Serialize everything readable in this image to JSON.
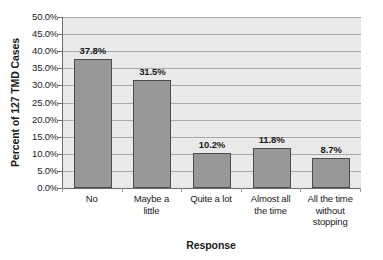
{
  "chart_data": {
    "type": "bar",
    "title": "",
    "xlabel": "Response",
    "ylabel": "Percent of 127 TMD Cases",
    "categories": [
      "No",
      "Maybe a little",
      "Quite a lot",
      "Almost all the time",
      "All the time without stopping"
    ],
    "category_lines": [
      [
        "No"
      ],
      [
        "Maybe a",
        "little"
      ],
      [
        "Quite a lot"
      ],
      [
        "Almost all",
        "the time"
      ],
      [
        "All the time",
        "without",
        "stopping"
      ]
    ],
    "values": [
      37.8,
      31.5,
      10.2,
      11.8,
      8.7
    ],
    "value_labels": [
      "37.8%",
      "31.5%",
      "10.2%",
      "11.8%",
      "8.7%"
    ],
    "ylim": [
      0,
      50
    ],
    "ytick_values": [
      0,
      5,
      10,
      15,
      20,
      25,
      30,
      35,
      40,
      45,
      50
    ],
    "ytick_labels": [
      "0.0%",
      "5.0%",
      "10.0%",
      "15.0%",
      "20.0%",
      "25.0%",
      "30.0%",
      "35.0%",
      "40.0%",
      "45.0%",
      "50.0%"
    ],
    "grid": "horizontal",
    "legend": "none",
    "colors": {
      "bar_fill": "#989898",
      "bar_border": "#4d4d4d",
      "plot_background": "#e9e9e9",
      "gridline": "#a9a9a9",
      "axis_line": "#6e6e6e",
      "text": "#1a1a1a",
      "page_background": "#ffffff"
    }
  }
}
